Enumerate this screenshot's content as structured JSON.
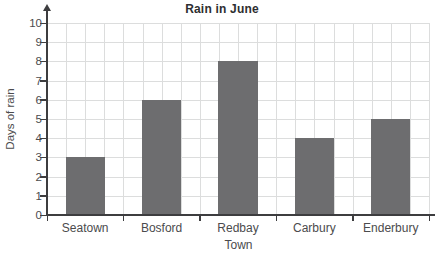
{
  "chart_data": {
    "type": "bar",
    "title": "Rain in June",
    "xlabel": "Town",
    "ylabel": "Days of rain",
    "categories": [
      "Seatown",
      "Bosford",
      "Redbay",
      "Carbury",
      "Enderbury"
    ],
    "values": [
      3,
      6,
      8,
      4,
      5
    ],
    "ylim": [
      0,
      10
    ],
    "ytick_step": 1,
    "grid": "on",
    "minor_x_divisions_per_category": 4,
    "legend": "none",
    "colors": {
      "bar": "#6d6d6f",
      "gridline": "#dcdddd",
      "axis": "#3d3d3f",
      "tick_text": "#4b4b4d",
      "title_text": "#2e2e30",
      "background": "#ffffff"
    }
  }
}
